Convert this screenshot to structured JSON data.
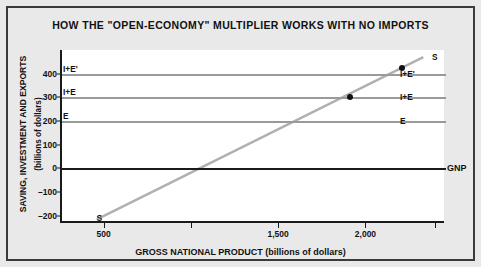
{
  "chart_data": {
    "type": "line",
    "title": "HOW THE \"OPEN-ECONOMY\" MULTIPLIER WORKS WITH NO IMPORTS",
    "xlabel": "GROSS NATIONAL PRODUCT (billions of dollars)",
    "ylabel": "SAVING, INVESTMENT AND EXPORTS",
    "ylabel_units": "(billions of dollars)",
    "xlim": [
      250,
      2450
    ],
    "ylim": [
      -230,
      500
    ],
    "grid": false,
    "legend_position": "inline-right",
    "x_ticks": [
      500,
      1000,
      1500,
      2000,
      2400
    ],
    "x_tick_labels": [
      "500",
      "",
      "1,500",
      "2,000",
      ""
    ],
    "y_ticks": [
      400,
      300,
      200,
      100,
      0,
      -100,
      -200
    ],
    "y_tick_labels": [
      "400",
      "300",
      "200",
      "100",
      "0",
      "-100",
      "-200"
    ],
    "series": [
      {
        "name": "S",
        "label": "S",
        "type": "line",
        "color": "#b0b0b0",
        "x": [
          450,
          2320
        ],
        "values": [
          -215,
          470
        ],
        "description": "Upward sloping saving schedule"
      },
      {
        "name": "I+E'",
        "label": "I+E'",
        "type": "hline",
        "color": "#9a9a9a",
        "value": 400
      },
      {
        "name": "I+E",
        "label": "I+E",
        "type": "hline",
        "color": "#9a9a9a",
        "value": 300
      },
      {
        "name": "E",
        "label": "E",
        "type": "hline",
        "color": "#9a9a9a",
        "value": 200
      },
      {
        "name": "GNP",
        "label": "GNP",
        "type": "hline",
        "color": "#1a1a1a",
        "value": 0
      }
    ],
    "points": [
      {
        "name": "equilibrium-1",
        "x": 1900,
        "y": 300
      },
      {
        "name": "equilibrium-2",
        "x": 2200,
        "y": 425
      }
    ],
    "annotations": [
      {
        "name": "s-start-label",
        "text": "S",
        "x": 470,
        "y": -210
      },
      {
        "name": "s-end-label",
        "text": "S",
        "x": 2330,
        "y": 465
      }
    ]
  },
  "axis": {
    "y_title": "SAVING, INVESTMENT AND EXPORTS",
    "y_subtitle": "(billions of dollars)",
    "x_title": "GROSS NATIONAL PRODUCT (billions of dollars)"
  },
  "left_labels": [
    {
      "text": "I+E'",
      "value": 400
    },
    {
      "text": "I+E",
      "value": 300
    },
    {
      "text": "E",
      "value": 200
    }
  ],
  "right_labels": [
    {
      "text": "S",
      "value": 470
    },
    {
      "text": "I+E'",
      "value": 400
    },
    {
      "text": "I+E",
      "value": 300
    },
    {
      "text": "E",
      "value": 200
    },
    {
      "text": "GNP",
      "value": 0
    }
  ],
  "colors": {
    "background": "#e9e9e9",
    "plot_background": "#ffffff",
    "frame": "#3a3a3a",
    "axis": "#1a1a1a",
    "series_gray": "#9a9a9a",
    "s_line": "#b0b0b0",
    "dot": "#111111"
  }
}
